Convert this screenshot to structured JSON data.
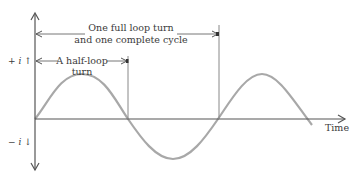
{
  "diagram": {
    "type": "sine-wave-cycle",
    "axes": {
      "x_label": "Time",
      "y_positive_label": "+ i ↑",
      "y_negative_label": "− i ↓"
    },
    "annotations": {
      "full_cycle": {
        "line1": "One full loop turn",
        "line2": "and one complete cycle"
      },
      "half_cycle": {
        "line1": "A half-loop",
        "line2": "turn"
      }
    },
    "colors": {
      "axis": "#555555",
      "wave": "#a8a8a8",
      "text": "#3a3a3a",
      "marker_line": "#777777"
    }
  }
}
